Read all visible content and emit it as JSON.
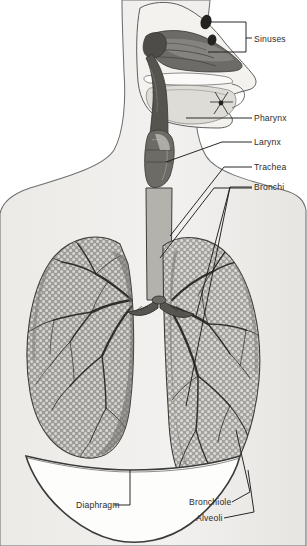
{
  "figure": {
    "view": "sagittal head section with anterior thorax",
    "background_color": "#ffffff",
    "body_fill": "#efeeec",
    "outline_color": "#6a6a6a",
    "lung_fill": "#9a9a98",
    "lung_stipple": "#d9d8d4",
    "tree_color": "#2f2f2f",
    "label_color": "#2b2b2b",
    "leader_color": "#1d1d1d"
  },
  "labels": [
    {
      "id": "sinuses",
      "text": "Sinuses",
      "x": 254,
      "y": 42
    },
    {
      "id": "pharynx",
      "text": "Pharynx",
      "x": 254,
      "y": 120
    },
    {
      "id": "larynx",
      "text": "Larynx",
      "x": 254,
      "y": 145
    },
    {
      "id": "trachea",
      "text": "Trachea",
      "x": 254,
      "y": 170
    },
    {
      "id": "bronchi",
      "text": "Bronchi",
      "x": 254,
      "y": 190
    },
    {
      "id": "diaphragm",
      "text": "Diaphragm",
      "x": 76,
      "y": 508
    },
    {
      "id": "bronchiole",
      "text": "Bronchiole",
      "x": 189,
      "y": 505
    },
    {
      "id": "alveoli",
      "text": "Alveoli",
      "x": 196,
      "y": 521
    }
  ],
  "structures": [
    {
      "id": "nasal-cavity",
      "name": "Nasal cavity with turbinates"
    },
    {
      "id": "sinus-upper",
      "name": "Frontal sinus cavity"
    },
    {
      "id": "sinus-lower",
      "name": "Sphenoid sinus cavity"
    },
    {
      "id": "oral-cavity",
      "name": "Oral cavity and tongue"
    },
    {
      "id": "pharynx",
      "name": "Pharynx"
    },
    {
      "id": "larynx",
      "name": "Larynx"
    },
    {
      "id": "trachea",
      "name": "Trachea with cartilage rings"
    },
    {
      "id": "bronchus-left",
      "name": "Left primary bronchus"
    },
    {
      "id": "bronchus-right",
      "name": "Right primary bronchus"
    },
    {
      "id": "lung-left",
      "name": "Left lung"
    },
    {
      "id": "lung-right",
      "name": "Right lung"
    },
    {
      "id": "diaphragm",
      "name": "Diaphragm"
    },
    {
      "id": "bronchiole",
      "name": "Bronchiole"
    },
    {
      "id": "alveoli",
      "name": "Alveoli"
    }
  ]
}
